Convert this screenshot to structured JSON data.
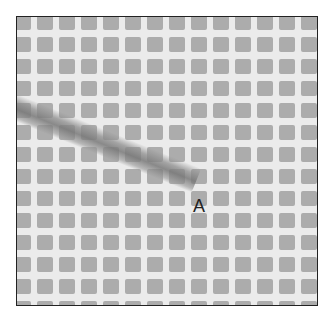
{
  "image": {
    "subject": "mesh grid fabric with diagonal thread",
    "label": "A",
    "colors": {
      "background": "#ffffff",
      "mesh_gap": "#ebebeb",
      "mesh_cell": "#a6a6a6",
      "thread": "#8c8c8c",
      "border": "#222222",
      "label": "#222222"
    }
  }
}
